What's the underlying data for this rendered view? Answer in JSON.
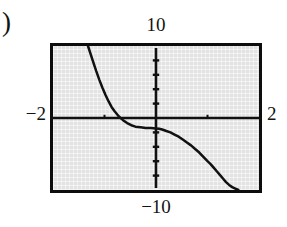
{
  "figure": {
    "part_label": ")",
    "caption": ""
  },
  "chart_data": {
    "type": "line",
    "title": "",
    "xlabel": "",
    "ylabel": "",
    "xlim": [
      -2,
      2
    ],
    "ylim": [
      -10,
      10
    ],
    "grid": false,
    "legend": null,
    "axis_labels": {
      "ymax": "10",
      "ymin": "−10",
      "xmin": "−2",
      "xmax": "2"
    },
    "tick_spacing": {
      "x": 1,
      "y": 2
    },
    "series": [
      {
        "name": "curve",
        "comment": "decreasing cubic-like curve with flat inflection plateau left of the origin",
        "x": [
          -1.32,
          -1.28,
          -1.22,
          -1.16,
          -1.1,
          -1.04,
          -0.98,
          -0.92,
          -0.86,
          -0.8,
          -0.72,
          -0.64,
          -0.56,
          -0.48,
          -0.4,
          -0.3,
          -0.2,
          -0.1,
          0.0,
          0.06,
          0.12,
          0.2,
          0.28,
          0.36,
          0.44,
          0.52,
          0.6,
          0.68,
          0.76,
          0.84,
          0.92,
          1.0,
          1.06,
          1.12,
          1.18,
          1.24,
          1.3,
          1.36,
          1.42,
          1.48,
          1.54,
          1.6
        ],
        "y": [
          10.0,
          9.1,
          7.8,
          6.5,
          5.3,
          4.2,
          3.2,
          2.3,
          1.5,
          0.9,
          0.2,
          -0.3,
          -0.7,
          -1.0,
          -1.2,
          -1.3,
          -1.4,
          -1.4,
          -1.45,
          -1.5,
          -1.6,
          -1.8,
          -2.0,
          -2.3,
          -2.6,
          -3.0,
          -3.4,
          -3.8,
          -4.3,
          -4.8,
          -5.4,
          -6.0,
          -6.4,
          -6.9,
          -7.4,
          -7.9,
          -8.4,
          -8.9,
          -9.3,
          -9.6,
          -9.8,
          -10.0
        ]
      }
    ],
    "x_axis_ticks": [
      -1.0,
      1.0
    ],
    "y_axis_ticks": [
      -8,
      -6,
      -4,
      -2,
      2,
      4,
      6,
      8
    ]
  },
  "colors": {
    "screen_background": "#e3e3e3",
    "frame": "#0d0d0d",
    "axis": "#101010",
    "curve": "#111111",
    "page_background": "#ffffff",
    "text": "#131313"
  }
}
